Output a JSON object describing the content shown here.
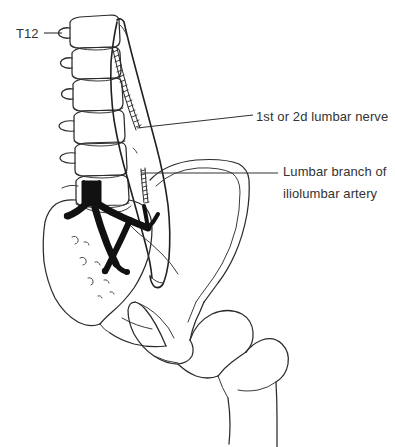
{
  "figure": {
    "background_color": "#ffffff",
    "ink_color": "#2b2b2b",
    "vessel_color": "#111111",
    "text_color": "#333333"
  },
  "labels": {
    "t12": {
      "text": "T12",
      "target": "twelfth-thoracic-vertebra"
    },
    "lumbar_nerve": {
      "text": "1st or 2d lumbar nerve",
      "target": "lumbar-nerve-structure"
    },
    "iliolumbar_artery": {
      "line1": "Lumbar branch of",
      "line2": "iliolumbar artery",
      "target": "iliolumbar-artery-branch"
    }
  },
  "structures": {
    "vertebrae": [
      "T12 vertebral body",
      "L1 vertebral body",
      "L2 vertebral body",
      "L3 vertebral body",
      "L4 vertebral body",
      "L5 vertebral body"
    ],
    "other": [
      "sacrum",
      "ilium",
      "iliac crest",
      "obturator foramen",
      "pubic bone",
      "ischium",
      "femoral head",
      "greater trochanter",
      "femoral shaft",
      "psoas major muscle",
      "abdominal aorta",
      "common iliac arteries"
    ]
  }
}
